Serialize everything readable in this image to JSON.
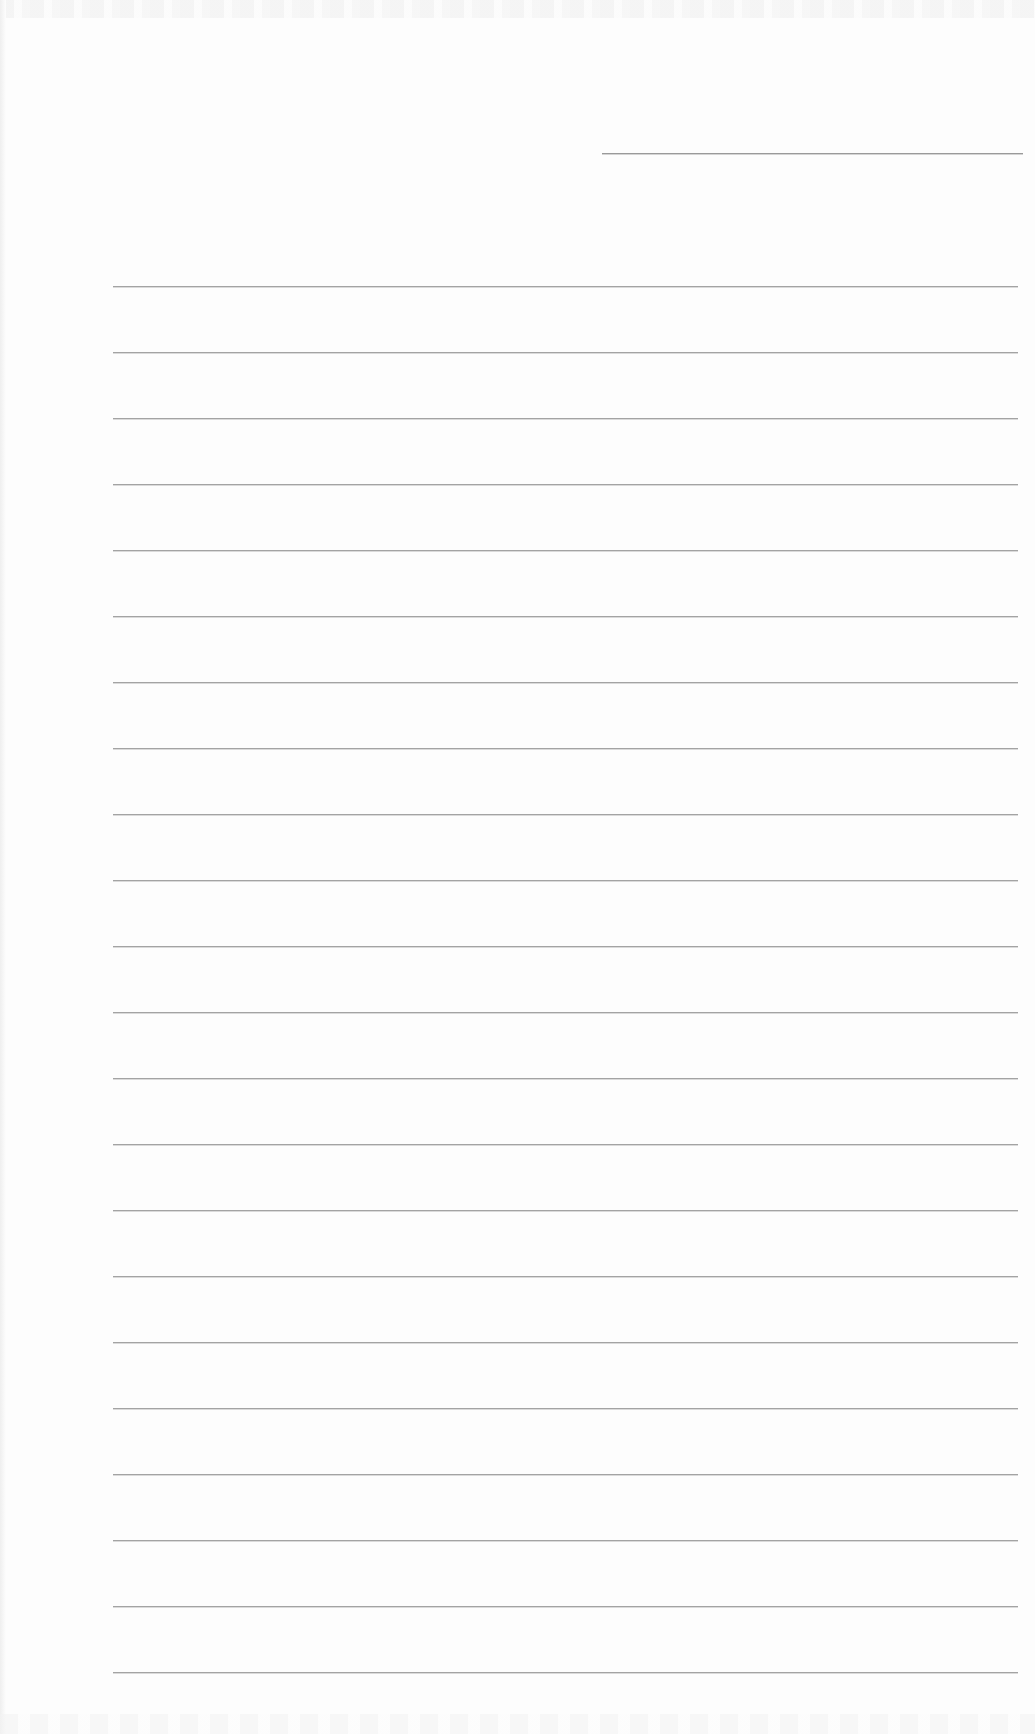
{
  "page": {
    "type": "blank lined paper (scanned)",
    "background_color": "#fdfdfd",
    "line_color": "#a3a3a3"
  },
  "header_line": {
    "x_start": 602,
    "x_end": 1023,
    "y": 153
  },
  "ruled_lines": {
    "x_start": 113,
    "x_end": 1018,
    "y_positions": [
      286,
      352,
      418,
      484,
      550,
      616,
      682,
      748,
      814,
      880,
      946,
      1012,
      1078,
      1144,
      1210,
      1276,
      1342,
      1408,
      1474,
      1540,
      1606,
      1672
    ]
  }
}
